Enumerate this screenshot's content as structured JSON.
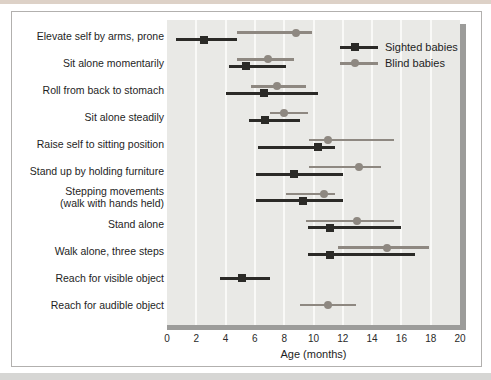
{
  "figure": {
    "top_strip_color": "#ddd1c7",
    "bottom_strip_color": "#d6d6d4",
    "frame_color": "#b2b0ae",
    "plot_background": "#e9e9e6",
    "axis_bar_color": "#9c9c9a",
    "gridline_color": "#f9f9f7"
  },
  "chart_data": {
    "type": "scatter",
    "title": "",
    "xlabel": "Age (months)",
    "ylabel": "",
    "xlim": [
      0,
      20
    ],
    "xticks": [
      0,
      2,
      4,
      6,
      8,
      10,
      12,
      14,
      16,
      18,
      20
    ],
    "grid": "vertical-light",
    "legend_position": "top-right",
    "categories": [
      "Elevate self by arms, prone",
      "Sit alone momentarily",
      "Roll from back to stomach",
      "Sit alone steadily",
      "Raise self to sitting position",
      "Stand up by holding furniture",
      "Stepping movements\n(walk with hands held)",
      "Stand alone",
      "Walk alone, three steps",
      "Reach for visible object",
      "Reach for audible object"
    ],
    "legend": [
      {
        "label": "Sighted babies",
        "marker": "square",
        "color": "#2b2a27"
      },
      {
        "label": "Blind babies",
        "marker": "circle",
        "color": "#8e8881"
      }
    ],
    "series": [
      {
        "name": "Sighted babies",
        "marker": "square",
        "color": "#2b2a27",
        "unit": "months",
        "points": [
          {
            "mean": 2.5,
            "lo": 0.6,
            "hi": 4.8
          },
          {
            "mean": 5.4,
            "lo": 4.2,
            "hi": 8.1
          },
          {
            "mean": 6.6,
            "lo": 4.0,
            "hi": 10.3
          },
          {
            "mean": 6.7,
            "lo": 5.6,
            "hi": 9.1
          },
          {
            "mean": 10.3,
            "lo": 6.2,
            "hi": 11.5
          },
          {
            "mean": 8.7,
            "lo": 6.1,
            "hi": 12.0
          },
          {
            "mean": 9.3,
            "lo": 6.1,
            "hi": 12.0
          },
          {
            "mean": 11.1,
            "lo": 9.6,
            "hi": 16.0
          },
          {
            "mean": 11.1,
            "lo": 9.6,
            "hi": 16.9
          },
          {
            "mean": 5.1,
            "lo": 3.6,
            "hi": 7.0
          },
          null
        ]
      },
      {
        "name": "Blind babies",
        "marker": "circle",
        "color": "#8e8881",
        "unit": "months",
        "points": [
          {
            "mean": 8.8,
            "lo": 4.8,
            "hi": 9.9
          },
          {
            "mean": 6.9,
            "lo": 4.8,
            "hi": 8.7
          },
          {
            "mean": 7.5,
            "lo": 5.7,
            "hi": 9.5
          },
          {
            "mean": 8.0,
            "lo": 7.0,
            "hi": 9.6
          },
          {
            "mean": 11.0,
            "lo": 9.7,
            "hi": 15.5
          },
          {
            "mean": 13.1,
            "lo": 9.7,
            "hi": 14.6
          },
          {
            "mean": 10.7,
            "lo": 8.1,
            "hi": 11.5
          },
          {
            "mean": 13.0,
            "lo": 9.5,
            "hi": 15.5
          },
          {
            "mean": 15.0,
            "lo": 11.7,
            "hi": 17.9
          },
          null,
          {
            "mean": 11.0,
            "lo": 9.1,
            "hi": 12.9
          }
        ]
      }
    ]
  }
}
